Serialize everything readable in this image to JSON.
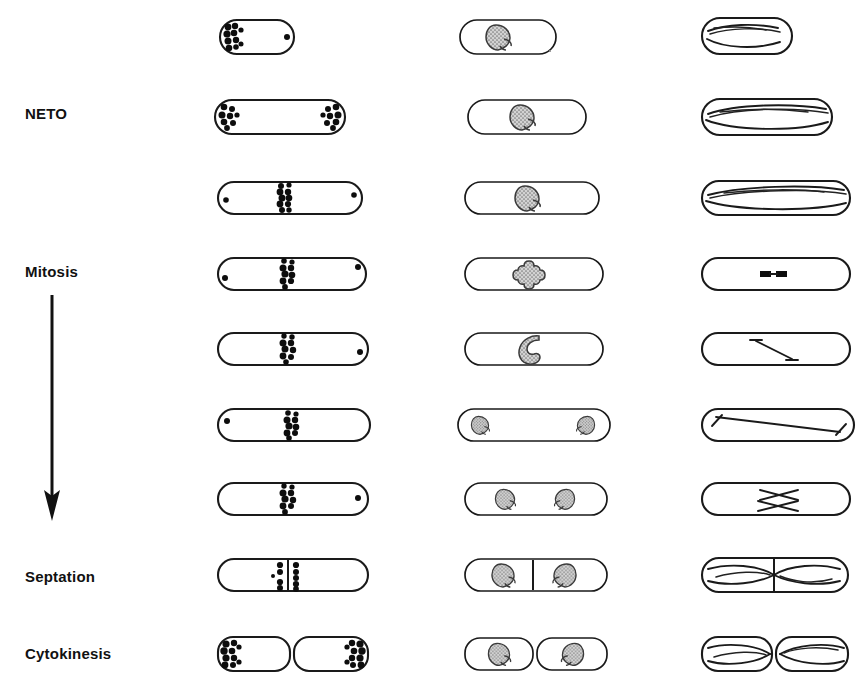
{
  "figure": {
    "type": "cell-cycle-schematic",
    "organism_depiction": "rod-shaped fission yeast cell",
    "columns": [
      {
        "id": "actin",
        "content": "actin patches and ring (filled dots)"
      },
      {
        "id": "nucleus",
        "content": "nucleus with nucleolus (stippled grey body)"
      },
      {
        "id": "microtubules",
        "content": "microtubule arrays (lines)"
      }
    ]
  },
  "stage_labels": [
    {
      "id": "neto",
      "text": "NETO",
      "x": 25,
      "y": 105
    },
    {
      "id": "mitosis",
      "text": "Mitosis",
      "x": 25,
      "y": 263
    },
    {
      "id": "septation",
      "text": "Septation",
      "x": 25,
      "y": 568
    },
    {
      "id": "cytokinesis",
      "text": "Cytokinesis",
      "x": 25,
      "y": 645
    }
  ],
  "progression_arrow": {
    "name": "cell-cycle-direction-arrow",
    "x": 52,
    "y_start": 295,
    "y_end": 520,
    "direction": "downward"
  },
  "colors": {
    "outline": "#1a1a1a",
    "actin": "#0d0d0d",
    "nucleus_fill": "#c9c9c9",
    "nucleolus_fill": "#b0b0b0",
    "background": "#ffffff"
  },
  "rows": [
    {
      "index": 0,
      "stage": "early G2 / monopolar growth",
      "y": 35,
      "cell": {
        "x": 218,
        "w": 74,
        "h": 34
      },
      "actin": {
        "pattern": "cluster-left-end",
        "tip_dot_right": true
      },
      "nucleus": {
        "x": 458,
        "w": 98,
        "h": 34,
        "count": 1,
        "shape": "round-with-nucleolus",
        "flip": false
      },
      "microtubules": {
        "x": 700,
        "w": 92,
        "h": 34,
        "pattern": "interphase-bundles"
      }
    },
    {
      "index": 1,
      "stage": "NETO - new end take off",
      "y": 116,
      "cell": {
        "x": 215,
        "w": 128,
        "h": 34
      },
      "actin": {
        "pattern": "cluster-both-ends"
      },
      "nucleus": {
        "x": 468,
        "w": 118,
        "h": 34,
        "count": 1,
        "shape": "round-with-nucleolus",
        "flip": false
      },
      "microtubules": {
        "x": 700,
        "w": 130,
        "h": 36,
        "pattern": "interphase-bundles"
      }
    },
    {
      "index": 2,
      "stage": "late G2 / bipolar growth",
      "y": 196,
      "cell": {
        "x": 218,
        "w": 142,
        "h": 32
      },
      "actin": {
        "pattern": "medial-ring-forming",
        "tip_dot_left": true,
        "tip_dot_right": true
      },
      "nucleus": {
        "x": 465,
        "w": 132,
        "h": 32,
        "count": 1,
        "shape": "round-with-nucleolus",
        "flip": false
      },
      "microtubules": {
        "x": 700,
        "w": 148,
        "h": 34,
        "pattern": "interphase-bundles"
      }
    },
    {
      "index": 3,
      "stage": "mitosis - metaphase",
      "y": 272,
      "cell": {
        "x": 218,
        "w": 146,
        "h": 32
      },
      "actin": {
        "pattern": "medial-ring",
        "tip_dot_left": true,
        "tip_dot_right": true
      },
      "nucleus": {
        "x": 465,
        "w": 136,
        "h": 32,
        "count": 1,
        "shape": "cloverleaf-condensed"
      },
      "microtubules": {
        "x": 700,
        "w": 148,
        "h": 32,
        "pattern": "short-spindle-bars"
      }
    },
    {
      "index": 4,
      "stage": "mitosis - early anaphase",
      "y": 347,
      "cell": {
        "x": 218,
        "w": 148,
        "h": 32
      },
      "actin": {
        "pattern": "medial-ring",
        "tip_dot_right": true
      },
      "nucleus": {
        "x": 465,
        "w": 136,
        "h": 32,
        "count": 1,
        "shape": "crescent"
      },
      "microtubules": {
        "x": 700,
        "w": 148,
        "h": 32,
        "pattern": "elongating-spindle"
      }
    },
    {
      "index": 5,
      "stage": "anaphase B - spindle elongation",
      "y": 423,
      "cell": {
        "x": 218,
        "w": 150,
        "h": 32
      },
      "actin": {
        "pattern": "medial-ring",
        "tip_dot_left": true
      },
      "nucleus": {
        "x": 458,
        "w": 150,
        "h": 32,
        "count": 2,
        "shape": "separated-poles"
      },
      "microtubules": {
        "x": 700,
        "w": 150,
        "h": 32,
        "pattern": "long-spindle"
      }
    },
    {
      "index": 6,
      "stage": "post-anaphase",
      "y": 497,
      "cell": {
        "x": 218,
        "w": 148,
        "h": 32
      },
      "actin": {
        "pattern": "medial-ring",
        "tip_dot_right": true
      },
      "nucleus": {
        "x": 465,
        "w": 140,
        "h": 32,
        "count": 2,
        "shape": "two-daughter-nuclei"
      },
      "microtubules": {
        "x": 700,
        "w": 148,
        "h": 32,
        "pattern": "post-anaphase-array"
      }
    },
    {
      "index": 7,
      "stage": "septation",
      "y": 573,
      "cell": {
        "x": 218,
        "w": 148,
        "h": 32
      },
      "actin": {
        "pattern": "septum-flanking-dots",
        "septum": true
      },
      "nucleus": {
        "x": 465,
        "w": 140,
        "h": 32,
        "count": 2,
        "septum": true
      },
      "microtubules": {
        "x": 700,
        "w": 146,
        "h": 34,
        "pattern": "reforming-interphase",
        "septum": true
      }
    },
    {
      "index": 8,
      "stage": "cytokinesis / cell separation",
      "y": 651,
      "cell": {
        "x": 218,
        "w": 148,
        "h": 34,
        "split": true
      },
      "actin": {
        "pattern": "cluster-outer-ends"
      },
      "nucleus": {
        "x": 465,
        "w": 142,
        "h": 34,
        "count": 2,
        "split": true
      },
      "microtubules": {
        "x": 700,
        "w": 148,
        "h": 34,
        "pattern": "reforming-interphase",
        "split": true
      }
    }
  ]
}
